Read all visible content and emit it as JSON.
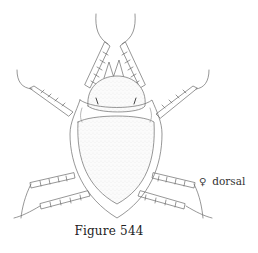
{
  "figure": {
    "caption": "Figure 544",
    "view_symbol": "♀",
    "view_label": "dorsal",
    "line_color": "#555555",
    "stipple_color": "#bbbbbb",
    "background": "#ffffff"
  }
}
